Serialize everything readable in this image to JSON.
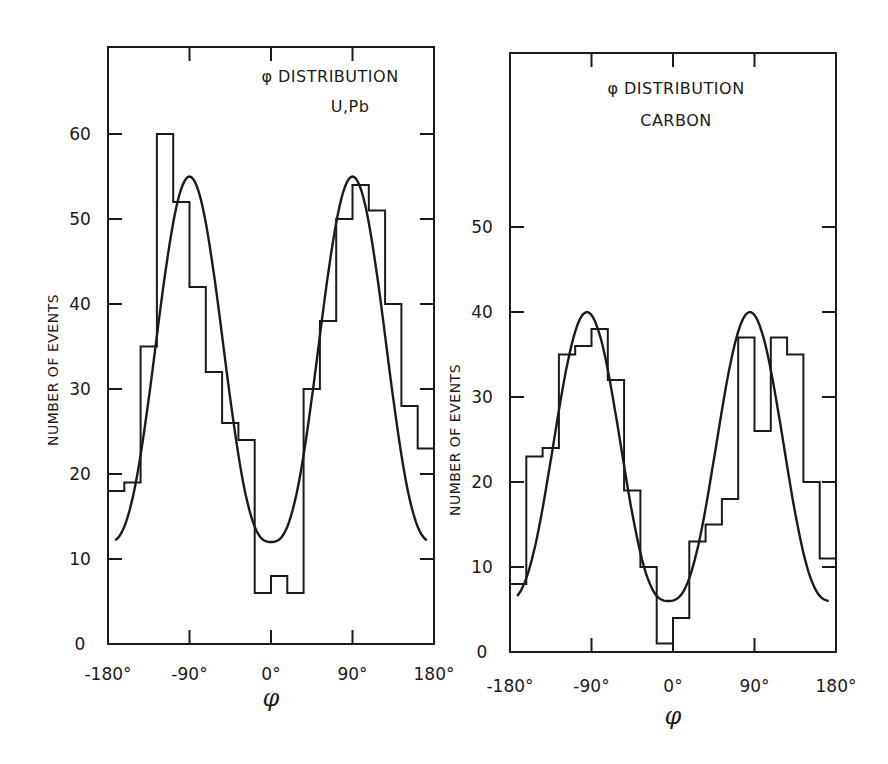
{
  "chart_data": [
    {
      "type": "bar",
      "subtype": "histogram_with_fit",
      "title": "φ DISTRIBUTION",
      "subtitle": "U,Pb",
      "xlabel": "φ",
      "ylabel": "NUMBER OF EVENTS",
      "xlim": [
        -180,
        180
      ],
      "ylim": [
        0,
        60
      ],
      "xticks": [
        "-180°",
        "-90°",
        "0°",
        "90°",
        "180°"
      ],
      "yticks": [
        "0",
        "10",
        "20",
        "30",
        "40",
        "50",
        "60"
      ],
      "bin_width_deg": 18,
      "bin_edges": [
        -180,
        -162,
        -144,
        -126,
        -108,
        -90,
        -72,
        -54,
        -36,
        -18,
        0,
        18,
        36,
        54,
        72,
        90,
        108,
        126,
        144,
        162,
        180
      ],
      "values": [
        18,
        19,
        35,
        60,
        52,
        42,
        32,
        26,
        24,
        6,
        8,
        6,
        30,
        38,
        50,
        54,
        51,
        40,
        28,
        23
      ],
      "fit": {
        "description": "smooth fitted curve",
        "min": 12,
        "min_at": 0,
        "peaks": [
          {
            "x": -100,
            "y": 55
          },
          {
            "x": 95,
            "y": 55
          }
        ],
        "ends": [
          15,
          16
        ]
      },
      "grid": false
    },
    {
      "type": "bar",
      "subtype": "histogram_with_fit",
      "title": "φ DISTRIBUTION",
      "subtitle": "CARBON",
      "xlabel": "φ",
      "ylabel": "NUMBER OF EVENTS",
      "xlim": [
        -180,
        180
      ],
      "ylim": [
        0,
        50
      ],
      "xticks": [
        "-180°",
        "-90°",
        "0°",
        "90°",
        "180°"
      ],
      "yticks": [
        "0",
        "10",
        "20",
        "30",
        "40",
        "50"
      ],
      "bin_width_deg": 18,
      "bin_edges": [
        -180,
        -162,
        -144,
        -126,
        -108,
        -90,
        -72,
        -54,
        -36,
        -18,
        0,
        18,
        36,
        54,
        72,
        90,
        108,
        126,
        144,
        162,
        180
      ],
      "values": [
        8,
        23,
        24,
        35,
        36,
        38,
        32,
        19,
        10,
        1,
        4,
        13,
        15,
        18,
        37,
        26,
        37,
        35,
        20,
        11
      ],
      "fit": {
        "description": "smooth fitted curve",
        "min": 6,
        "min_at": -5,
        "peaks": [
          {
            "x": -92,
            "y": 40
          },
          {
            "x": 88,
            "y": 40
          }
        ],
        "ends": [
          7,
          8
        ]
      },
      "grid": false
    }
  ],
  "panels": {
    "left": {
      "title": "φ DISTRIBUTION",
      "subtitle": "U,Pb",
      "ylabel": "NUMBER OF EVENTS",
      "xlabel": "φ"
    },
    "right": {
      "title": "φ DISTRIBUTION",
      "subtitle": "CARBON",
      "ylabel": "NUMBER OF EVENTS",
      "xlabel": "φ"
    }
  }
}
